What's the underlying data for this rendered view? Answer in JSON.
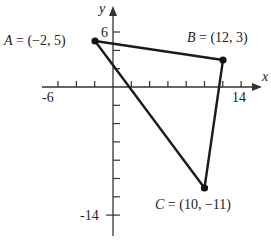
{
  "diagram": {
    "type": "triangle-on-coordinate-plane",
    "axes": {
      "x_label": "x",
      "y_label": "y",
      "x_tick_labels": [
        "-6",
        "14"
      ],
      "y_tick_labels": [
        "6",
        "-14"
      ],
      "tick_spacing_units": 2
    },
    "points": [
      {
        "name": "A",
        "label": "A = (−2, 5)",
        "letter": "A",
        "coords": " = (−2, 5)",
        "x": -2,
        "y": 5
      },
      {
        "name": "B",
        "label": "B = (12, 3)",
        "letter": "B",
        "coords": " = (12, 3)",
        "x": 12,
        "y": 3
      },
      {
        "name": "C",
        "label": "C = (10, −11)",
        "letter": "C",
        "coords": " = (10, −11)",
        "x": 10,
        "y": -11
      }
    ],
    "colors": {
      "line": "#1a1a1a",
      "background": "#ffffff"
    }
  }
}
